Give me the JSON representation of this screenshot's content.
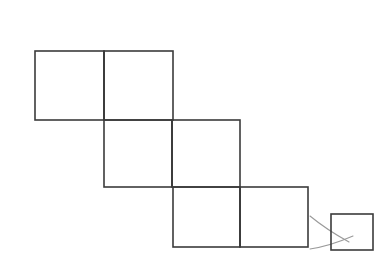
{
  "page": {
    "background_color": "#ffffff",
    "width": 386,
    "height": 255
  },
  "style": {
    "square_stroke_color": "#3b3b3b",
    "square_stroke_width": 1.6,
    "connector_stroke_color": "#9a9a9a",
    "connector_stroke_width": 1.1,
    "fill": "none"
  },
  "chart_data": {
    "type": "diagram",
    "title": "",
    "xlabel": "",
    "ylabel": "",
    "grid": false,
    "legend": null,
    "units": "pixels",
    "rows": [
      {
        "name": "row-1",
        "y_top": 51,
        "y_bottom": 120,
        "cell_size": 69,
        "cells": [
          {
            "name": "row1-cell-left",
            "x_left": 35,
            "x_right": 104,
            "width": 69,
            "height": 69
          },
          {
            "name": "row1-cell-right",
            "x_left": 104,
            "x_right": 173,
            "width": 69,
            "height": 69
          }
        ]
      },
      {
        "name": "row-2",
        "y_top": 120,
        "y_bottom": 187,
        "cell_size": 68,
        "cells": [
          {
            "name": "row2-cell-left",
            "x_left": 104,
            "x_right": 172,
            "width": 68,
            "height": 67
          },
          {
            "name": "row2-cell-right",
            "x_left": 172,
            "x_right": 240,
            "width": 68,
            "height": 67
          }
        ]
      },
      {
        "name": "row-3",
        "y_top": 187,
        "y_bottom": 247,
        "cell_size": 67,
        "cells": [
          {
            "name": "row3-cell-left",
            "x_left": 173,
            "x_right": 240,
            "width": 67,
            "height": 60
          },
          {
            "name": "row3-cell-right",
            "x_left": 240,
            "x_right": 308,
            "width": 68,
            "height": 60
          }
        ]
      }
    ],
    "detached_square": {
      "name": "small-square",
      "x_left": 331,
      "x_right": 373,
      "y_top": 214,
      "y_bottom": 250,
      "width": 42,
      "height": 36
    },
    "connectors": [
      {
        "name": "connector-upper",
        "from": [
          310,
          216
        ],
        "control": [
          327,
          230
        ],
        "to": [
          349,
          242
        ],
        "style": "curve"
      },
      {
        "name": "connector-lower",
        "from": [
          310,
          249
        ],
        "control": [
          330,
          246
        ],
        "to": [
          353,
          236
        ],
        "style": "curve"
      }
    ]
  }
}
